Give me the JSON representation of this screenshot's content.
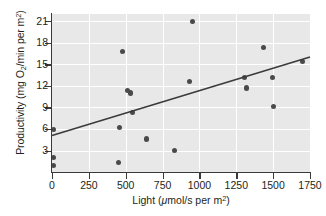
{
  "chart_data": {
    "type": "scatter",
    "title": "",
    "xlabel": "Light (μmol/s per m²)",
    "ylabel": "Productivity (mg O₂/min per m²)",
    "xlim": [
      0,
      1750
    ],
    "ylim": [
      0,
      22
    ],
    "xticks": [
      0,
      250,
      500,
      750,
      1000,
      1250,
      1500,
      1750
    ],
    "yticks": [
      3,
      6,
      9,
      12,
      15,
      18,
      21
    ],
    "xtick_labels": [
      "0",
      "250",
      "500",
      "750",
      "1000",
      "1250",
      "1500",
      "1750"
    ],
    "ytick_labels": [
      "3",
      "6",
      "9",
      "12",
      "15",
      "18",
      "21"
    ],
    "grid": true,
    "legend": null,
    "plot_background": "#e8e8e8",
    "grid_color": "#ffffff",
    "point_color": "#4a4a4a",
    "line_color": "#3a3a3a",
    "points": [
      {
        "x": 10,
        "y": 5.9
      },
      {
        "x": 10,
        "y": 2.0
      },
      {
        "x": 10,
        "y": 0.9
      },
      {
        "x": 450,
        "y": 1.3
      },
      {
        "x": 455,
        "y": 6.2
      },
      {
        "x": 480,
        "y": 16.8
      },
      {
        "x": 515,
        "y": 11.4
      },
      {
        "x": 530,
        "y": 11.0
      },
      {
        "x": 545,
        "y": 8.3
      },
      {
        "x": 640,
        "y": 4.6
      },
      {
        "x": 830,
        "y": 3.0
      },
      {
        "x": 930,
        "y": 12.6
      },
      {
        "x": 955,
        "y": 21.0
      },
      {
        "x": 1305,
        "y": 13.2
      },
      {
        "x": 1320,
        "y": 11.7
      },
      {
        "x": 1435,
        "y": 17.3
      },
      {
        "x": 1495,
        "y": 13.1
      },
      {
        "x": 1500,
        "y": 9.1
      },
      {
        "x": 1700,
        "y": 15.4
      }
    ],
    "trendline": {
      "x0": 0,
      "y0": 5.1,
      "x1": 1750,
      "y1": 16.0
    }
  },
  "axis": {
    "ylabel_parts": {
      "pre": "Productivity (mg O",
      "sub": "2",
      "post": "/min per m",
      "sup": "2",
      "close": ")"
    },
    "xlabel_parts": {
      "pre": "Light (",
      "mu": "μ",
      "mid": "mol/s per m",
      "sup": "2",
      "close": ")"
    }
  }
}
